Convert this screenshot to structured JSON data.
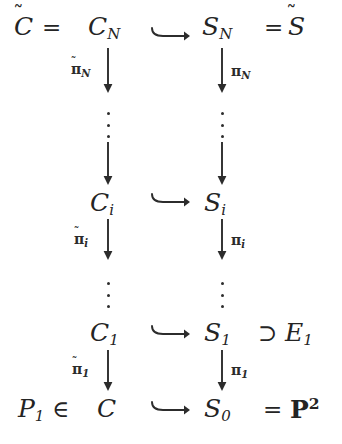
{
  "diagram": {
    "kind": "commutative-diagram",
    "background_color": "#ffffff",
    "ink_color": "#242424",
    "rows": [
      {
        "id": "row-N",
        "left_prefix": "C̃",
        "left_prefix_equals": "=",
        "left_term": "C",
        "left_sub": "N",
        "middle_rel": "↪",
        "right_term": "S",
        "right_sub": "N",
        "right_suffix_equals": "=",
        "right_suffix": "S̃"
      },
      {
        "id": "row-i",
        "left_term": "C",
        "left_sub": "i",
        "middle_rel": "↪",
        "right_term": "S",
        "right_sub": "i"
      },
      {
        "id": "row-1",
        "left_term": "C",
        "left_sub": "1",
        "middle_rel": "↪",
        "right_term": "S",
        "right_sub": "1",
        "right_rel": "⊃",
        "right_extra_term": "E",
        "right_extra_sub": "1"
      },
      {
        "id": "row-0",
        "left_prefix_term": "P",
        "left_prefix_sub": "1",
        "left_prefix_rel": "∈",
        "left_term": "C",
        "left_sub": "",
        "middle_rel": "↪",
        "right_term": "S",
        "right_sub": "0",
        "right_suffix_equals": "=",
        "right_suffix_bold": "P",
        "right_suffix_sup": "2"
      }
    ],
    "vertical_maps": [
      {
        "id": "map-left-N",
        "base": "π",
        "accent": "̃",
        "sub": "N",
        "side": "left",
        "column": "left"
      },
      {
        "id": "map-right-N",
        "base": "π",
        "accent": "",
        "sub": "N",
        "side": "right",
        "column": "right"
      },
      {
        "id": "map-left-i",
        "base": "π",
        "accent": "̃",
        "sub": "i",
        "side": "left",
        "column": "left"
      },
      {
        "id": "map-right-i",
        "base": "π",
        "accent": "",
        "sub": "i",
        "side": "right",
        "column": "right"
      },
      {
        "id": "map-left-1",
        "base": "π",
        "accent": "̃",
        "sub": "1",
        "side": "left",
        "column": "left"
      },
      {
        "id": "map-right-1",
        "base": "π",
        "accent": "",
        "sub": "1",
        "side": "right",
        "column": "right"
      }
    ],
    "ellipses": [
      {
        "id": "vdots-left-upper",
        "column": "left",
        "glyph": "⋮"
      },
      {
        "id": "vdots-right-upper",
        "column": "right",
        "glyph": "⋮"
      },
      {
        "id": "vdots-left-lower",
        "column": "left",
        "glyph": "⋮"
      },
      {
        "id": "vdots-right-lower",
        "column": "right",
        "glyph": "⋮"
      }
    ],
    "symbols": {
      "hook_arrow": "↪",
      "down_arrow": "↓",
      "supset": "⊃",
      "element_of": "∈",
      "equals": "=",
      "tilde": "̃",
      "vdots": "⋮"
    }
  }
}
